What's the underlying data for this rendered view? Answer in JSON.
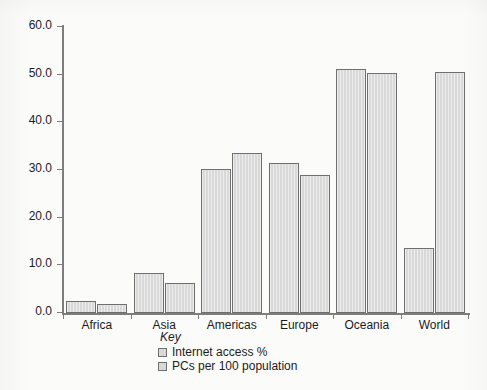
{
  "figure": {
    "background_color": "#fbfbfa",
    "bar_fill_color": "#d9d9d9",
    "bar_border_color": "#6f6f6f",
    "axis_color": "#7d7d7d",
    "text_color": "#1c1c1c"
  },
  "key": {
    "title": "Key",
    "entries": [
      {
        "label": "Internet access %"
      },
      {
        "label": "PCs per 100 population"
      }
    ]
  },
  "axes": {
    "y_ticks": [
      "0.0",
      "10.0",
      "20.0",
      "30.0",
      "40.0",
      "50.0",
      "60.0"
    ],
    "x_ticks": [
      "Africa",
      "Asia",
      "Americas",
      "Europe",
      "Oceania",
      "World"
    ]
  },
  "chart_data": {
    "type": "bar",
    "title": "",
    "xlabel": "",
    "ylabel": "",
    "ylim": [
      0,
      60
    ],
    "ytick_values": [
      0,
      10,
      20,
      30,
      40,
      50,
      60
    ],
    "ytick_labels": [
      "0.0",
      "10.0",
      "20.0",
      "30.0",
      "40.0",
      "50.0",
      "60.0"
    ],
    "grid": false,
    "legend_position": "below-axis-center",
    "legend_title": "Key",
    "categories": [
      "Africa",
      "Asia",
      "Americas",
      "Europe",
      "Oceania",
      "World"
    ],
    "series": [
      {
        "name": "Internet access %",
        "color": "#d9d9d9",
        "values": [
          2.6,
          8.3,
          30.3,
          31.5,
          51.2,
          13.7
        ]
      },
      {
        "name": "PCs per 100 population",
        "color": "#d9d9d9",
        "values": [
          1.8,
          6.3,
          33.6,
          28.9,
          50.3,
          50.5
        ]
      }
    ]
  },
  "page_artifacts": {
    "top_ghost": "",
    "bottom_ghost_1": "",
    "bottom_ghost_2": ""
  }
}
